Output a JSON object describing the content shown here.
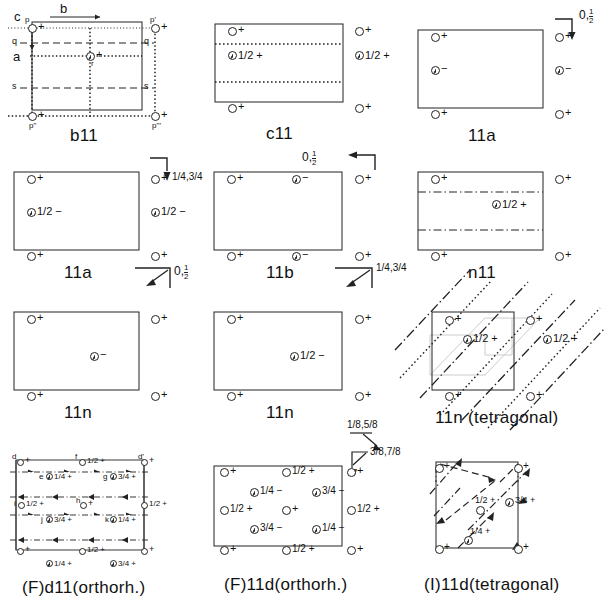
{
  "figure": {
    "background": "#ffffff",
    "ink": "#222222"
  },
  "panels": [
    {
      "id": "b11",
      "caption": "b11",
      "row": 0,
      "col": 0,
      "axes": {
        "c": "c",
        "b": "b",
        "a": "a"
      },
      "edge_labels": [
        "p",
        "p'",
        "p\"",
        "p'''",
        "q",
        "q",
        "s",
        "s",
        "r"
      ],
      "atoms": [
        {
          "label": "+",
          "pos": "top-left"
        },
        {
          "label": "+",
          "pos": "top-right-out"
        },
        {
          "label": "+",
          "pos": "bottom-left"
        },
        {
          "label": "+",
          "pos": "bottom-right-out"
        },
        {
          "label": "+",
          "pos": "center",
          "comma": true
        }
      ],
      "line_types": [
        "dashed",
        "dotted",
        "solid"
      ]
    },
    {
      "id": "c11",
      "caption": "c11",
      "row": 0,
      "col": 1,
      "atoms": [
        {
          "label": "+",
          "pos": "top-left"
        },
        {
          "label": "+",
          "pos": "top-right-out"
        },
        {
          "label": "1/2 +",
          "pos": "upper-mid-left",
          "comma": true
        },
        {
          "label": "1/2 +",
          "pos": "upper-mid-right-out",
          "comma": true
        },
        {
          "label": "+",
          "pos": "bottom-left"
        },
        {
          "label": "+",
          "pos": "bottom-right-out"
        }
      ],
      "line_types": [
        "dotted"
      ]
    },
    {
      "id": "11a-top",
      "caption": "11a",
      "row": 0,
      "col": 2,
      "corner_annotation": "0,½",
      "corner_arrow": "down",
      "atoms": [
        {
          "label": "+",
          "pos": "top-left"
        },
        {
          "label": "+",
          "pos": "top-right-out"
        },
        {
          "label": "−",
          "pos": "mid-left",
          "comma": true
        },
        {
          "label": "−",
          "pos": "mid-right-out",
          "comma": true
        },
        {
          "label": "+",
          "pos": "bottom-left"
        },
        {
          "label": "+",
          "pos": "bottom-right-out"
        }
      ]
    },
    {
      "id": "11a-second",
      "caption": "11a",
      "row": 1,
      "col": 0,
      "corner_annotation": "1/4, 3/4",
      "corner_arrow": "down",
      "atoms": [
        {
          "label": "+",
          "pos": "top-left"
        },
        {
          "label": "+",
          "pos": "top-right-out"
        },
        {
          "label": "1/2 −",
          "pos": "mid-left",
          "comma": true
        },
        {
          "label": "1/2 −",
          "pos": "mid-right-out",
          "comma": true
        },
        {
          "label": "+",
          "pos": "bottom-left"
        },
        {
          "label": "+",
          "pos": "bottom-right-out"
        }
      ]
    },
    {
      "id": "11b",
      "caption": "11b",
      "row": 1,
      "col": 1,
      "corner_annotation": "0,½",
      "corner_arrow": "left",
      "atoms": [
        {
          "label": "+",
          "pos": "top-left"
        },
        {
          "label": "−",
          "pos": "top-mid",
          "comma": true
        },
        {
          "label": "+",
          "pos": "top-right-out"
        },
        {
          "label": "+",
          "pos": "bottom-left"
        },
        {
          "label": "−",
          "pos": "bottom-mid",
          "comma": true
        },
        {
          "label": "+",
          "pos": "bottom-right-out"
        }
      ]
    },
    {
      "id": "n11",
      "caption": "n11",
      "row": 1,
      "col": 2,
      "atoms": [
        {
          "label": "+",
          "pos": "top-left"
        },
        {
          "label": "+",
          "pos": "top-right-out"
        },
        {
          "label": "1/2 +",
          "pos": "upper-mid",
          "comma": true
        },
        {
          "label": "+",
          "pos": "bottom-left"
        },
        {
          "label": "+",
          "pos": "bottom-right-out"
        }
      ],
      "line_types": [
        "dash-dot"
      ]
    },
    {
      "id": "11n-left",
      "caption": "11n",
      "row": 2,
      "col": 0,
      "corner_annotation": "0,½",
      "corner_arrow": "diag-down-left",
      "atoms": [
        {
          "label": "+",
          "pos": "top-left"
        },
        {
          "label": "+",
          "pos": "top-right-out"
        },
        {
          "label": "−",
          "pos": "center",
          "comma": true
        },
        {
          "label": "+",
          "pos": "bottom-left"
        },
        {
          "label": "+",
          "pos": "bottom-right-out"
        }
      ]
    },
    {
      "id": "11n-mid",
      "caption": "11n",
      "row": 2,
      "col": 1,
      "corner_annotation": "1/4, 3/4",
      "corner_arrow": "diag-down-left",
      "atoms": [
        {
          "label": "+",
          "pos": "top-left"
        },
        {
          "label": "+",
          "pos": "top-right-out"
        },
        {
          "label": "1/2 −",
          "pos": "center",
          "comma": true
        },
        {
          "label": "+",
          "pos": "bottom-left"
        },
        {
          "label": "+",
          "pos": "bottom-right-out"
        }
      ]
    },
    {
      "id": "11n-tetragonal",
      "caption": "11n (tetragonal)",
      "row": 2,
      "col": 2,
      "atoms": [
        {
          "label": "+",
          "pos": "top-left"
        },
        {
          "label": "+",
          "pos": "top-right-out"
        },
        {
          "label": "1/2 +",
          "pos": "upper-mid-left",
          "comma": true
        },
        {
          "label": "1/2 +",
          "pos": "upper-mid-right-out",
          "comma": true
        },
        {
          "label": "+",
          "pos": "bottom-left"
        },
        {
          "label": "+",
          "pos": "bottom-right-out"
        }
      ],
      "line_types": [
        "dash-dot-diagonal",
        "dotted-diagonal"
      ]
    },
    {
      "id": "Fd11-orthorh",
      "caption": "(F)d11(orthorh.)",
      "row": 3,
      "col": 0,
      "point_letters": [
        "d",
        "f",
        "d'",
        "e",
        "g",
        "i",
        "h",
        "j",
        "k"
      ],
      "atoms": [
        {
          "label": "+",
          "pos": "top-left"
        },
        {
          "label": "1/2 +",
          "pos": "top-mid"
        },
        {
          "label": "+",
          "pos": "top-right"
        },
        {
          "label": "1/4 +",
          "pos": "row1-left",
          "comma": true
        },
        {
          "label": "3/4 +",
          "pos": "row1-right",
          "comma": true
        },
        {
          "label": "1/2 +",
          "pos": "mid-left"
        },
        {
          "label": "+",
          "pos": "mid-center"
        },
        {
          "label": "1/2 +",
          "pos": "mid-right"
        },
        {
          "label": "3/4 +",
          "pos": "row2-left",
          "comma": true
        },
        {
          "label": "1/4 +",
          "pos": "row2-right",
          "comma": true
        },
        {
          "label": "+",
          "pos": "bottom-left"
        },
        {
          "label": "1/2 +",
          "pos": "bottom-mid"
        },
        {
          "label": "+",
          "pos": "bottom-right"
        },
        {
          "label": "1/4 +",
          "pos": "below-left",
          "comma": true
        },
        {
          "label": "3/4 +",
          "pos": "below-right",
          "comma": true
        }
      ],
      "line_types": [
        "dash-dot-arrowed"
      ]
    },
    {
      "id": "F11d-orthorh",
      "caption": "(F)11d(orthorh.)",
      "row": 3,
      "col": 1,
      "corner_annotations": [
        "1/8, 5/8",
        "3/8, 7/8"
      ],
      "atoms": [
        {
          "label": "+",
          "pos": "top-left"
        },
        {
          "label": "1/2 +",
          "pos": "top-mid"
        },
        {
          "label": "+",
          "pos": "top-right-out"
        },
        {
          "label": "1/4 −",
          "pos": "r1-left",
          "comma": true
        },
        {
          "label": "3/4 −",
          "pos": "r1-right",
          "comma": true
        },
        {
          "label": "1/2 +",
          "pos": "mid-left"
        },
        {
          "label": "+",
          "pos": "mid-center"
        },
        {
          "label": "1/2 +",
          "pos": "mid-right-out"
        },
        {
          "label": "3/4 −",
          "pos": "r2-left",
          "comma": true
        },
        {
          "label": "1/4 −",
          "pos": "r2-right",
          "comma": true
        },
        {
          "label": "+",
          "pos": "bottom-left"
        },
        {
          "label": "1/2 +",
          "pos": "bottom-mid"
        },
        {
          "label": "+",
          "pos": "bottom-right-out"
        }
      ]
    },
    {
      "id": "I11d-tetragonal",
      "caption": "(I)11d(tetragonal)",
      "row": 3,
      "col": 2,
      "atoms": [
        {
          "label": "+",
          "pos": "top-left"
        },
        {
          "label": "+",
          "pos": "top-right"
        },
        {
          "label": "1/2 +",
          "pos": "center"
        },
        {
          "label": "3/4 +",
          "pos": "right-mid",
          "comma": true
        },
        {
          "label": "1/4 +",
          "pos": "lower-mid",
          "comma": true
        },
        {
          "label": "+",
          "pos": "bottom-left"
        },
        {
          "label": "+",
          "pos": "bottom-right"
        }
      ],
      "line_types": [
        "dashed-diagonal-arrow",
        "dash-dot-diagonal"
      ]
    }
  ],
  "captions": {
    "r0c0": "b11",
    "r0c1": "c11",
    "r0c2": "11a",
    "r1c0": "11a",
    "r1c1": "11b",
    "r1c2": "n11",
    "r2c0": "11n",
    "r2c1": "11n",
    "r2c2": "11n (tetragonal)",
    "r3c0": "(F)d11(orthorh.)",
    "r3c1": "(F)11d(orthorh.)",
    "r3c2": "(I)11d(tetragonal)"
  },
  "annotations": {
    "a_zero_half": "0,",
    "a_half_frac_num": "1",
    "a_half_frac_den": "2",
    "a_quarter_three_quarter": "1/4,3/4",
    "a_eighth_fiveeighth": "1/8,5/8",
    "a_threeeighth_seveneighth": "3/8,7/8"
  },
  "axes": {
    "c": "c",
    "b": "b",
    "a": "a"
  },
  "point_labels_b11": {
    "p": "p",
    "p1": "p'",
    "p2": "p\"",
    "p3": "p'''",
    "q_left": "q",
    "q_right": "q",
    "s_left": "s",
    "s_right": "s",
    "r": "r"
  },
  "point_labels_fd11": {
    "d": "d",
    "f": "f",
    "dprime": "d'",
    "e": "e",
    "g": "g",
    "i": "i",
    "h": "h",
    "j": "j",
    "k": "k"
  },
  "signs": {
    "plus": "+",
    "minus": "−",
    "half_plus": "1/2 +",
    "half_minus": "1/2 −",
    "quarter_plus": "1/4 +",
    "quarter_minus": "1/4 −",
    "three_quarter_plus": "3/4 +",
    "three_quarter_minus": "3/4 −"
  }
}
